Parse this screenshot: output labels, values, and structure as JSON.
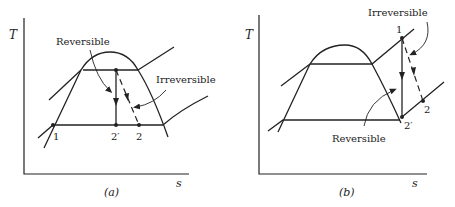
{
  "diagrams": [
    {
      "id": "a",
      "caption": "(a)",
      "y_axis_label": "T",
      "x_axis_label": "s",
      "labels": {
        "reversible": "Reversible",
        "irreversible": "Irreversible",
        "point_1": "1",
        "point_2prime": "2′",
        "point_2": "2"
      }
    },
    {
      "id": "b",
      "caption": "(b)",
      "y_axis_label": "T",
      "x_axis_label": "s",
      "labels": {
        "reversible": "Reversible",
        "irreversible": "Irreversible",
        "point_1": "1",
        "point_2prime": "2′",
        "point_2": "2"
      }
    }
  ],
  "colors": {
    "ink": "#222222",
    "background": "#ffffff"
  }
}
